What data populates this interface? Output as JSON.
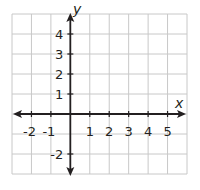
{
  "title": "",
  "colors": {
    "grid": "#c8c8c8",
    "axis": "#231f20",
    "background": "#ffffff"
  },
  "axes": {
    "x_label": "x",
    "y_label": "y",
    "x_range": [
      -3,
      6
    ],
    "y_range": [
      -3,
      5
    ]
  },
  "x_ticks": [
    {
      "value": -2,
      "label": "-2"
    },
    {
      "value": -1,
      "label": "-1"
    },
    {
      "value": 1,
      "label": "1"
    },
    {
      "value": 2,
      "label": "2"
    },
    {
      "value": 3,
      "label": "3"
    },
    {
      "value": 4,
      "label": "4"
    },
    {
      "value": 5,
      "label": "5"
    }
  ],
  "y_ticks": [
    {
      "value": 4,
      "label": "4"
    },
    {
      "value": 3,
      "label": "3"
    },
    {
      "value": 2,
      "label": "2"
    },
    {
      "value": 1,
      "label": "1"
    },
    {
      "value": -2,
      "label": "-2"
    }
  ],
  "chart_data": {
    "type": "coordinate-plane",
    "title": "",
    "xlabel": "x",
    "ylabel": "y",
    "xlim": [
      -3,
      6
    ],
    "ylim": [
      -3,
      5
    ],
    "grid": true,
    "x_tick_labels": [
      "-2",
      "-1",
      "1",
      "2",
      "3",
      "4",
      "5"
    ],
    "y_tick_labels": [
      "4",
      "3",
      "2",
      "1",
      "-2"
    ],
    "series": []
  }
}
